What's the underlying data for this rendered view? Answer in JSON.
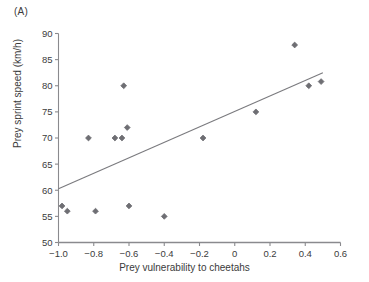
{
  "figure": {
    "panel_label": "(A)"
  },
  "chart_data": {
    "type": "scatter",
    "title": "",
    "xlabel": "Prey vulnerability to cheetahs",
    "ylabel": "Prey sprint speed (km/h)",
    "xlim": [
      -1.0,
      0.6
    ],
    "ylim": [
      50,
      90
    ],
    "xticks": [
      -1.0,
      -0.8,
      -0.6,
      -0.4,
      -0.2,
      0,
      0.2,
      0.4,
      0.6
    ],
    "xtick_labels": [
      "−1.0",
      "−0.8",
      "−0.6",
      "−0.4",
      "−0.2",
      "0",
      "0.2",
      "0.4",
      "0.6"
    ],
    "yticks": [
      50,
      55,
      60,
      65,
      70,
      75,
      80,
      85,
      90
    ],
    "ytick_labels": [
      "50",
      "55",
      "60",
      "65",
      "70",
      "75",
      "80",
      "85",
      "90"
    ],
    "grid": false,
    "legend": null,
    "marker": "diamond",
    "marker_color": "#6e6e73",
    "line_color": "#7a7a7e",
    "axis_color": "#8a8a8e",
    "points": [
      {
        "x": -0.98,
        "y": 57
      },
      {
        "x": -0.95,
        "y": 56
      },
      {
        "x": -0.83,
        "y": 70
      },
      {
        "x": -0.79,
        "y": 56
      },
      {
        "x": -0.68,
        "y": 70
      },
      {
        "x": -0.64,
        "y": 70
      },
      {
        "x": -0.63,
        "y": 80
      },
      {
        "x": -0.61,
        "y": 72
      },
      {
        "x": -0.6,
        "y": 57
      },
      {
        "x": -0.4,
        "y": 55
      },
      {
        "x": -0.18,
        "y": 70
      },
      {
        "x": 0.12,
        "y": 75
      },
      {
        "x": 0.34,
        "y": 87.8
      },
      {
        "x": 0.42,
        "y": 80
      },
      {
        "x": 0.49,
        "y": 80.8
      }
    ],
    "fit_line": {
      "x_start": -1.0,
      "y_start": 60.3,
      "x_end": 0.5,
      "y_end": 82.5
    }
  }
}
